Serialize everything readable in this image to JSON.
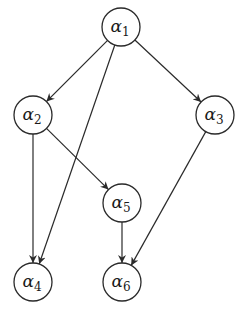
{
  "diagram": {
    "type": "directed-graph",
    "colors": {
      "stroke": "#2a2a2a",
      "text": "#1a1a1a",
      "background": "#ffffff"
    },
    "node_radius": 19,
    "nodes": [
      {
        "id": "a1",
        "symbol": "α",
        "subscript": "1",
        "x": 121,
        "y": 27
      },
      {
        "id": "a2",
        "symbol": "α",
        "subscript": "2",
        "x": 33,
        "y": 115
      },
      {
        "id": "a3",
        "symbol": "α",
        "subscript": "3",
        "x": 215,
        "y": 115
      },
      {
        "id": "a4",
        "symbol": "α",
        "subscript": "4",
        "x": 33,
        "y": 282
      },
      {
        "id": "a5",
        "symbol": "α",
        "subscript": "5",
        "x": 122,
        "y": 203
      },
      {
        "id": "a6",
        "symbol": "α",
        "subscript": "6",
        "x": 122,
        "y": 282
      }
    ],
    "edges": [
      {
        "from": "a1",
        "to": "a2"
      },
      {
        "from": "a1",
        "to": "a4"
      },
      {
        "from": "a1",
        "to": "a3"
      },
      {
        "from": "a2",
        "to": "a4"
      },
      {
        "from": "a2",
        "to": "a5"
      },
      {
        "from": "a3",
        "to": "a6"
      },
      {
        "from": "a5",
        "to": "a6"
      }
    ]
  }
}
